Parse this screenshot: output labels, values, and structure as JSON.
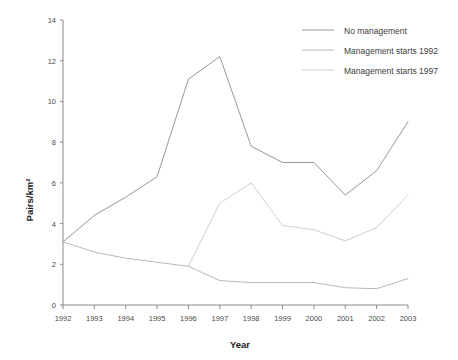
{
  "chart_data": {
    "type": "line",
    "title": "",
    "xlabel": "Year",
    "ylabel": "Pairs/km²",
    "x": [
      1992,
      1993,
      1994,
      1995,
      1996,
      1997,
      1998,
      1999,
      2000,
      2001,
      2002,
      2003
    ],
    "categories": [
      "1992",
      "1993",
      "1994",
      "1995",
      "1996",
      "1997",
      "1998",
      "1999",
      "2000",
      "2001",
      "2002",
      "2003"
    ],
    "xlim": [
      1992,
      2003
    ],
    "ylim": [
      0,
      14
    ],
    "yticks": [
      0,
      2,
      4,
      6,
      8,
      10,
      12,
      14
    ],
    "ytick_labels": [
      "0",
      "2",
      "4",
      "6",
      "8",
      "10",
      "12",
      "14"
    ],
    "grid": false,
    "legend_position": "top-right",
    "series": [
      {
        "name": "No management",
        "color": "#8c8c8c",
        "values": [
          3.1,
          4.4,
          5.3,
          6.3,
          11.1,
          12.2,
          7.8,
          7.0,
          7.0,
          5.4,
          6.6,
          9.0
        ]
      },
      {
        "name": "Management starts 1992",
        "color": "#b0b0b0",
        "values": [
          3.1,
          2.6,
          2.3,
          2.1,
          1.9,
          1.2,
          1.1,
          1.1,
          1.1,
          0.85,
          0.8,
          1.3
        ]
      },
      {
        "name": "Management starts 1997",
        "color": "#c9c9c9",
        "values": [
          null,
          null,
          null,
          null,
          1.9,
          5.0,
          6.0,
          3.9,
          3.7,
          3.15,
          3.8,
          5.4
        ]
      }
    ]
  },
  "legend": {
    "entries": [
      {
        "label": "No management"
      },
      {
        "label": "Management starts 1992"
      },
      {
        "label": "Management starts 1997"
      }
    ]
  },
  "axes": {
    "x_title": "Year",
    "y_title": "Pairs/km²"
  }
}
